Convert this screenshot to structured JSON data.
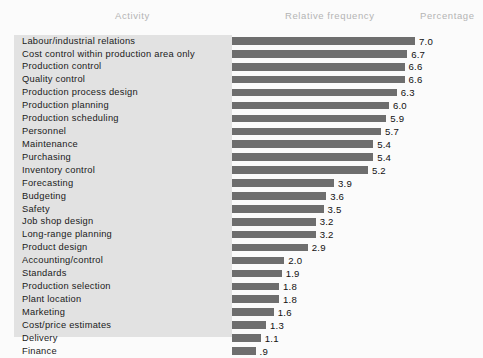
{
  "header": {
    "activity": "Activity",
    "relative_frequency": "Relative frequency",
    "percentage": "Percentage"
  },
  "colors": {
    "background": "#fbfbfb",
    "panel": "#e2e2e2",
    "bar": "#6e6e6e",
    "header_text": "#b4b4b4",
    "label_text": "#1a1a1a"
  },
  "chart_data": {
    "type": "bar",
    "orientation": "horizontal",
    "title": "",
    "xlabel": "Relative frequency",
    "ylabel": "Activity",
    "value_label_suffix": "",
    "grid": false,
    "legend": null,
    "xlim": [
      0,
      7.0
    ],
    "categories": [
      "Labour/industrial relations",
      "Cost control within production area only",
      "Production control",
      "Quality control",
      "Production process design",
      "Production planning",
      "Production scheduling",
      "Personnel",
      "Maintenance",
      "Purchasing",
      "Inventory control",
      "Forecasting",
      "Budgeting",
      "Safety",
      "Job shop design",
      "Long-range planning",
      "Product design",
      "Accounting/control",
      "Standards",
      "Production selection",
      "Plant location",
      "Marketing",
      "Cost/price estimates",
      "Delivery",
      "Finance"
    ],
    "values": [
      7.0,
      6.7,
      6.6,
      6.6,
      6.3,
      6.0,
      5.9,
      5.7,
      5.4,
      5.4,
      5.2,
      3.9,
      3.6,
      3.5,
      3.2,
      3.2,
      2.9,
      2.0,
      1.9,
      1.8,
      1.8,
      1.6,
      1.3,
      1.1,
      0.9
    ],
    "value_labels": [
      "7.0",
      "6.7",
      "6.6",
      "6.6",
      "6.3",
      "6.0",
      "5.9",
      "5.7",
      "5.4",
      "5.4",
      "5.2",
      "3.9",
      "3.6",
      "3.5",
      "3.2",
      "3.2",
      "2.9",
      "2.0",
      "1.9",
      "1.8",
      "1.8",
      "1.6",
      "1.3",
      "1.1",
      ".9"
    ]
  }
}
